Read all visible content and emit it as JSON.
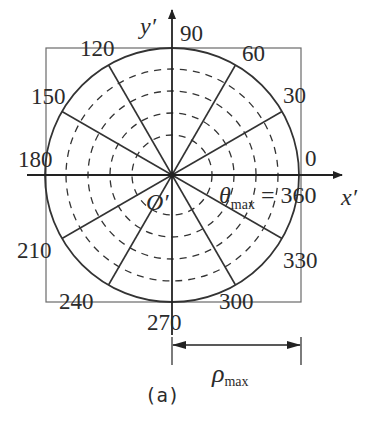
{
  "figure": {
    "caption": "(a)",
    "axes": {
      "x_label": "x′",
      "y_label": "y′",
      "origin_label": "O′"
    },
    "angle_labels": [
      {
        "text": "0",
        "x": 305,
        "y": 166
      },
      {
        "text": "30",
        "x": 283,
        "y": 103
      },
      {
        "text": "60",
        "x": 242,
        "y": 61
      },
      {
        "text": "90",
        "x": 180,
        "y": 41
      },
      {
        "text": "120",
        "x": 80,
        "y": 56
      },
      {
        "text": "150",
        "x": 31,
        "y": 104
      },
      {
        "text": "180",
        "x": 18,
        "y": 167
      },
      {
        "text": "210",
        "x": 17,
        "y": 258
      },
      {
        "text": "240",
        "x": 59,
        "y": 309
      },
      {
        "text": "270",
        "x": 147,
        "y": 330
      },
      {
        "text": "300",
        "x": 219,
        "y": 309
      },
      {
        "text": "330",
        "x": 283,
        "y": 268
      }
    ],
    "theta_max_label": {
      "symbol": "θ",
      "subscript": "max",
      "equals": "= 360"
    },
    "rho_max_label": {
      "symbol": "ρ",
      "subscript": "max"
    },
    "geometry": {
      "center": [
        172,
        175
      ],
      "outer_radius": 127,
      "dashed_radii": [
        40,
        62,
        84,
        106
      ],
      "spoke_angles_deg": [
        30,
        60,
        120,
        150,
        210,
        240,
        300,
        330
      ],
      "bounding_box": {
        "left": 46,
        "top": 48,
        "right": 301,
        "bottom": 302
      }
    },
    "colors": {
      "line": "#333333",
      "box": "#666666",
      "text": "#2b2b2b"
    }
  }
}
